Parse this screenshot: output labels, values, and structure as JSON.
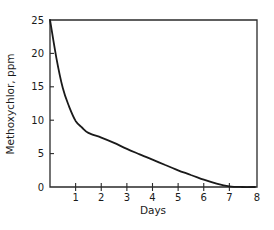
{
  "chart_data": {
    "type": "line",
    "title": "",
    "xlabel": "Days",
    "ylabel": "Methoxychlor, ppm",
    "xlim": [
      0,
      8
    ],
    "ylim": [
      0,
      25
    ],
    "xticks": [
      1,
      2,
      3,
      4,
      5,
      6,
      7,
      8
    ],
    "yticks": [
      0,
      5,
      10,
      15,
      20,
      25
    ],
    "grid": false,
    "legend": null,
    "frame": "box (top and right border lines)",
    "series": [
      {
        "name": "Methoxychlor",
        "color": "#1a1a1a",
        "x": [
          0,
          0.25,
          0.5,
          0.75,
          1,
          1.25,
          1.5,
          2,
          2.5,
          3,
          3.5,
          4,
          4.5,
          5,
          5.5,
          6,
          6.5,
          7,
          7.5,
          8
        ],
        "y": [
          25,
          19.3,
          14.8,
          12.0,
          9.9,
          8.9,
          8.1,
          7.4,
          6.6,
          5.7,
          4.9,
          4.1,
          3.3,
          2.5,
          1.8,
          1.1,
          0.5,
          0.1,
          0.0,
          0.0
        ]
      }
    ]
  },
  "axes": {
    "x_label": "Days",
    "y_label": "Methoxychlor, ppm",
    "x_tick_labels": [
      "1",
      "2",
      "3",
      "4",
      "5",
      "6",
      "7",
      "8"
    ],
    "y_tick_labels": [
      "0",
      "5",
      "10",
      "15",
      "20",
      "25"
    ]
  }
}
